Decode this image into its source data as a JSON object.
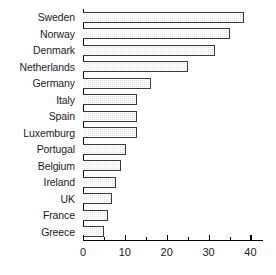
{
  "chart_data": {
    "type": "bar",
    "orientation": "horizontal",
    "title": "",
    "xlabel": "",
    "ylabel": "",
    "xlim": [
      0,
      43
    ],
    "grid": false,
    "legend": null,
    "xticks": [
      0,
      10,
      20,
      30,
      40
    ],
    "xtick_labels": [
      "0",
      "10",
      "20",
      "30",
      "40"
    ],
    "xminor_ticks": [
      5,
      15,
      25,
      35
    ],
    "categories": [
      "Sweden",
      "Norway",
      "Denmark",
      "Netherlands",
      "Germany",
      "Italy",
      "Spain",
      "Luxemburg",
      "Portugal",
      "Belgium",
      "Ireland",
      "UK",
      "France",
      "Greece"
    ],
    "values": [
      38.5,
      35,
      31.5,
      25,
      16.3,
      13,
      13,
      13,
      10.3,
      9,
      8,
      7,
      6,
      5
    ],
    "bar_fill_color": "#e2e2e2",
    "bar_edge_color": "#3a3a3a",
    "axis_color": "#000000"
  }
}
